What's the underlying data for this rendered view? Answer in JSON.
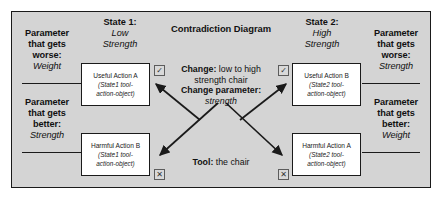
{
  "title": "Contradiction Diagram",
  "states": {
    "left": {
      "label": "State 1:",
      "value_line1": "Low",
      "value_line2": "Strength"
    },
    "right": {
      "label": "State 2:",
      "value_line1": "High",
      "value_line2": "Strength"
    }
  },
  "parameters": {
    "top_left": {
      "line1": "Parameter",
      "line2": "that gets",
      "line3": "worse:",
      "value": "Weight"
    },
    "bottom_left": {
      "line1": "Parameter",
      "line2": "that gets",
      "line3": "better:",
      "value": "Strength"
    },
    "top_right": {
      "line1": "Parameter",
      "line2": "that gets",
      "line3": "worse:",
      "value": "Strength"
    },
    "bottom_right": {
      "line1": "Parameter",
      "line2": "that gets",
      "line3": "better:",
      "value": "Weight"
    }
  },
  "center": {
    "change_label": "Change:",
    "change_value_line1": " low to high",
    "change_value_line2": "strength chair",
    "change_parameter_label": "Change parameter:",
    "change_parameter_value": "strength",
    "tool_label": "Tool:",
    "tool_value": " the chair"
  },
  "actions": {
    "useful_left": {
      "title": "Useful Action A",
      "sub_line1": "(State1 tool-",
      "sub_line2": "action-object)",
      "marker": "check"
    },
    "harmful_left": {
      "title": "Harmful Action B",
      "sub_line1": "(State1 tool-",
      "sub_line2": "action-object)",
      "marker": "cross"
    },
    "useful_right": {
      "title": "Useful Action B",
      "sub_line1": "(State2 tool-",
      "sub_line2": "action-object)",
      "marker": "check"
    },
    "harmful_right": {
      "title": "Harmful Action A",
      "sub_line1": "(State2 tool-",
      "sub_line2": "action-object)",
      "marker": "cross"
    }
  },
  "markers": {
    "check_glyph": "✓",
    "cross_glyph": "✕"
  },
  "colors": {
    "panel_background": "#d4d4d4",
    "box_background": "#ffffff",
    "line": "#1a1a1a",
    "text": "#111111"
  }
}
